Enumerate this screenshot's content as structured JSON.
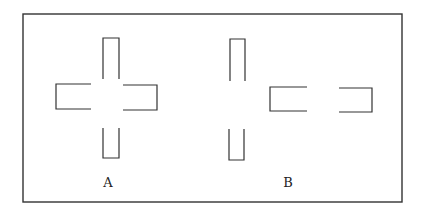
{
  "diagram": {
    "stroke_color": "#333333",
    "frame": {
      "x": 23,
      "y": 14,
      "width": 379,
      "height": 188
    },
    "figures": [
      {
        "label": "A",
        "label_pos": {
          "x": 108,
          "y": 187
        },
        "description": "cross shape composed of four open-ended arms meeting near a center gap",
        "parts": [
          {
            "name": "top-arm",
            "open_side": "bottom",
            "x1": 103,
            "y1": 38,
            "x2": 119,
            "y2": 79
          },
          {
            "name": "left-arm",
            "open_side": "right",
            "x1": 56,
            "y1": 84,
            "x2": 91,
            "y2": 109
          },
          {
            "name": "right-arm",
            "open_side": "left",
            "x1": 123,
            "y1": 85,
            "x2": 157,
            "y2": 110
          },
          {
            "name": "bottom-arm",
            "open_side": "top",
            "x1": 103,
            "y1": 128,
            "x2": 119,
            "y2": 158
          }
        ]
      },
      {
        "label": "B",
        "label_pos": {
          "x": 288,
          "y": 187
        },
        "description": "separated arms: vertical pair on left, horizontal pair displaced to the right",
        "parts": [
          {
            "name": "top-arm",
            "open_side": "bottom",
            "x1": 230,
            "y1": 39,
            "x2": 245,
            "y2": 81
          },
          {
            "name": "bottom-arm",
            "open_side": "top",
            "x1": 229,
            "y1": 129,
            "x2": 244,
            "y2": 160
          },
          {
            "name": "left-arm",
            "open_side": "right",
            "x1": 270,
            "y1": 87,
            "x2": 307,
            "y2": 111
          },
          {
            "name": "right-arm",
            "open_side": "left",
            "x1": 339,
            "y1": 88,
            "x2": 372,
            "y2": 112
          }
        ]
      }
    ]
  }
}
